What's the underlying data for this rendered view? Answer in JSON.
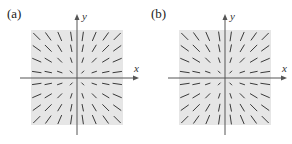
{
  "panels": [
    {
      "label": "(a)",
      "x_axis_label": "x",
      "y_axis_label": "y",
      "field": "radial",
      "scaled_by_distance": true
    },
    {
      "label": "(b)",
      "x_axis_label": "x",
      "y_axis_label": "y",
      "field": "radial",
      "scaled_by_distance": false
    }
  ],
  "colors": {
    "background": "#e6e6e6",
    "segment": "#3a3a3a",
    "axis": "#555555"
  },
  "grid": {
    "per_quadrant": 4
  }
}
